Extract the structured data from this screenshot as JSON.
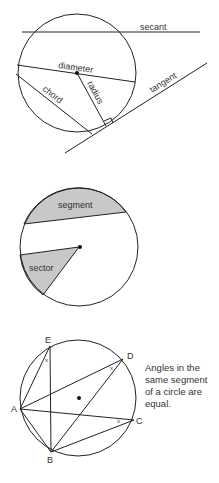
{
  "figure1": {
    "labels": {
      "secant": "secant",
      "diameter": "diameter",
      "chord": "chord",
      "radius": "radius",
      "tangent": "tangent"
    }
  },
  "figure2": {
    "labels": {
      "segment": "segment",
      "sector": "sector"
    },
    "shade_color": "#c8c8c8"
  },
  "figure3": {
    "points": {
      "A": "A",
      "B": "B",
      "C": "C",
      "D": "D",
      "E": "E"
    },
    "angle_mark": "x",
    "note_lines": [
      "Angles in the",
      "same segment",
      "of a circle are",
      "equal."
    ]
  },
  "colors": {
    "stroke": "#222222",
    "text": "#333333",
    "shade": "#c8c8c8"
  }
}
